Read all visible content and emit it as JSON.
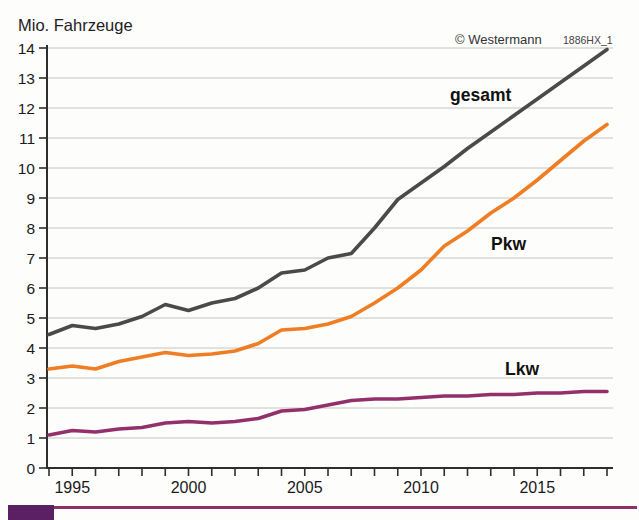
{
  "branding": {
    "publisher": "© Westermann",
    "code": "1886HX_1"
  },
  "chart_data": {
    "type": "line",
    "title": "",
    "ylabel": "Mio. Fahrzeuge",
    "xlabel": "",
    "ylim": [
      0,
      14
    ],
    "ytick_step": 1,
    "xlim": [
      1994,
      2018
    ],
    "xticks_labeled": [
      1995,
      2000,
      2005,
      2010,
      2015
    ],
    "grid": "horizontal-light",
    "legend": "inline-labels",
    "x": [
      1994,
      1995,
      1996,
      1997,
      1998,
      1999,
      2000,
      2001,
      2002,
      2003,
      2004,
      2005,
      2006,
      2007,
      2008,
      2009,
      2010,
      2011,
      2012,
      2013,
      2014,
      2015,
      2016,
      2017,
      2018
    ],
    "series": [
      {
        "name": "gesamt",
        "color": "#4a4a4a",
        "values": [
          4.45,
          4.75,
          4.65,
          4.8,
          5.05,
          5.45,
          5.25,
          5.5,
          5.65,
          6.0,
          6.5,
          6.6,
          7.0,
          7.15,
          8.0,
          8.95,
          9.5,
          10.05,
          10.65,
          11.2,
          11.75,
          12.3,
          12.85,
          13.4,
          13.95
        ]
      },
      {
        "name": "Pkw",
        "color": "#ef7d23",
        "values": [
          3.3,
          3.4,
          3.3,
          3.55,
          3.7,
          3.85,
          3.75,
          3.8,
          3.9,
          4.15,
          4.6,
          4.65,
          4.8,
          5.05,
          5.5,
          6.0,
          6.6,
          7.4,
          7.9,
          8.5,
          9.0,
          9.6,
          10.25,
          10.9,
          11.45
        ]
      },
      {
        "name": "Lkw",
        "color": "#93306c",
        "values": [
          1.1,
          1.25,
          1.2,
          1.3,
          1.35,
          1.5,
          1.55,
          1.5,
          1.55,
          1.65,
          1.9,
          1.95,
          2.1,
          2.25,
          2.3,
          2.3,
          2.35,
          2.4,
          2.4,
          2.45,
          2.45,
          2.5,
          2.5,
          2.55,
          2.55
        ]
      }
    ],
    "axis_color": "#2e2e2e",
    "gridline_color": "#c4c4c4",
    "label_color": "#1a1a1a"
  }
}
